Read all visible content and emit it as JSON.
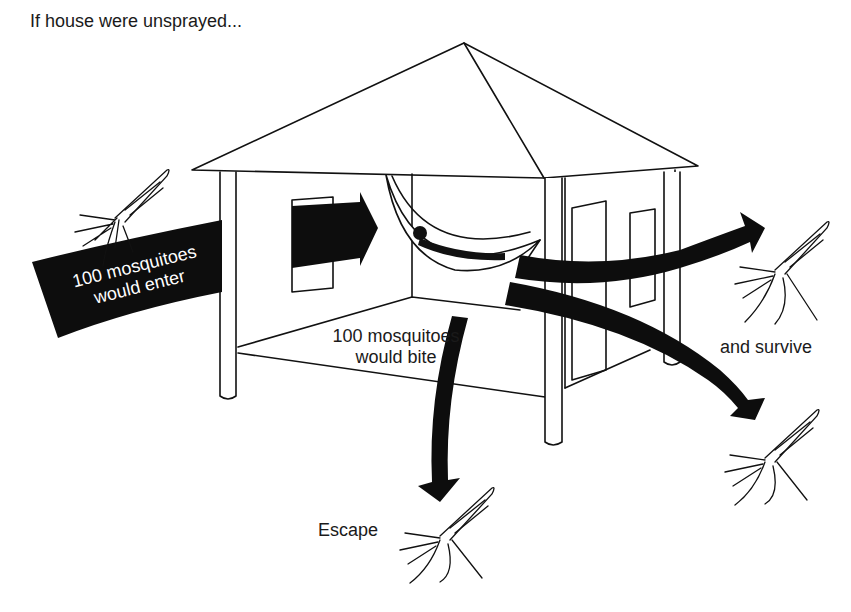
{
  "diagram": {
    "title": "If house were unsprayed...",
    "labels": {
      "enter_line1": "100 mosquitoes",
      "enter_line2": "would enter",
      "bite_line1": "100 mosquitoes",
      "bite_line2": "would bite",
      "survive": "and survive",
      "escape": "Escape"
    },
    "icons": [
      "house",
      "hammock-with-sleeper",
      "mosquito",
      "arrow"
    ],
    "colors": {
      "ink": "#111111",
      "background": "#ffffff",
      "arrow": "#0d0d0d"
    }
  }
}
